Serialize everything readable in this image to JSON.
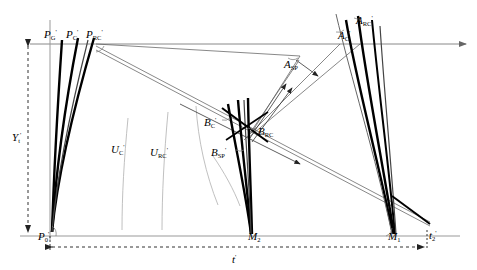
{
  "figure": {
    "type": "geometric-construction-diagram",
    "colors": {
      "curve": "#000000",
      "thin_line": "#555555",
      "axis": "#888888",
      "dashed": "#333333",
      "faint_arc": "#aaaaaa"
    }
  },
  "labels": {
    "top_left": [
      {
        "id": "P-G-prime",
        "base": "P",
        "sub": "G",
        "sup": "'",
        "x": 44,
        "y": 27
      },
      {
        "id": "P-C-prime",
        "base": "P",
        "sub": "C",
        "sup": "'",
        "x": 66,
        "y": 27
      },
      {
        "id": "P-RC-prime",
        "base": "P",
        "sub": "RC",
        "sup": "'",
        "x": 88,
        "y": 27
      }
    ],
    "top_right": [
      {
        "id": "A-RC-prime",
        "base": "A",
        "sub": "RC",
        "sup": "'",
        "x": 358,
        "y": 13
      },
      {
        "id": "A-C-prime",
        "base": "A",
        "sub": "C",
        "sup": "'",
        "x": 340,
        "y": 28
      }
    ],
    "mid_right": [
      {
        "id": "A-SP-prime",
        "base": "A",
        "sub": "SP",
        "sup": "'",
        "x": 285,
        "y": 58
      }
    ],
    "center": [
      {
        "id": "B-C-prime",
        "base": "B",
        "sub": "C",
        "sup": "'",
        "x": 206,
        "y": 116
      },
      {
        "id": "B-RC",
        "base": "B",
        "sub": "RC",
        "sup": "",
        "x": 258,
        "y": 126
      },
      {
        "id": "B-SP-prime",
        "base": "B",
        "sub": "SP",
        "sup": "'",
        "x": 213,
        "y": 146
      }
    ],
    "arc_family": [
      {
        "id": "U-C-prime",
        "base": "U",
        "sub": "C",
        "sup": "'",
        "x": 113,
        "y": 143
      },
      {
        "id": "U-RC-prime",
        "base": "U",
        "sub": "RC",
        "sup": "'",
        "x": 152,
        "y": 146
      }
    ],
    "axis": [
      {
        "id": "Y-t-prime",
        "base": "Y",
        "sub": "t",
        "sup": "'",
        "x": 14,
        "y": 131
      },
      {
        "id": "P-0-prime",
        "base": "P",
        "sub": "0",
        "sup": "'",
        "x": 40,
        "y": 229
      },
      {
        "id": "M-2",
        "base": "M",
        "sub": "2",
        "sup": "",
        "x": 252,
        "y": 229
      },
      {
        "id": "M-1",
        "base": "M",
        "sub": "1",
        "sup": "",
        "x": 391,
        "y": 229
      },
      {
        "id": "t-2-prime",
        "base": "t",
        "sub": "2",
        "sup": "'",
        "x": 427,
        "y": 228
      },
      {
        "id": "t-prime",
        "base": "t",
        "sub": "",
        "sup": "'",
        "x": 234,
        "y": 252
      }
    ]
  },
  "geometry": {
    "baseline_y": 236,
    "top_axis_y": 44,
    "vertical_axis_x": 50,
    "P0_x": 50,
    "M2_x": 251,
    "M1_x": 393,
    "t2_x": 427,
    "arrow_right_x": 466
  }
}
